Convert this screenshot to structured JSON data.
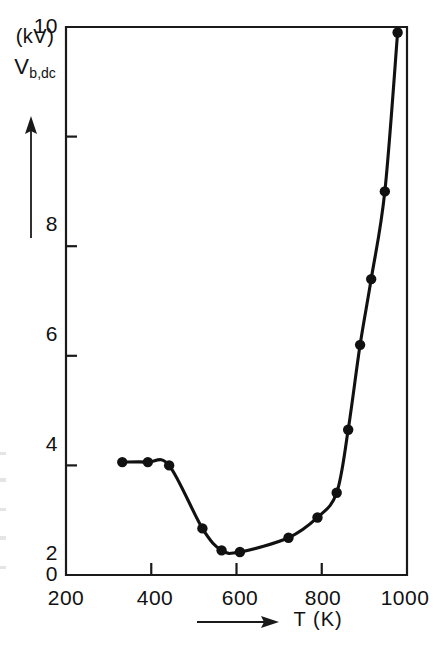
{
  "figure": {
    "title": "",
    "y_axis_caption_unit": "(kV)",
    "y_axis_caption_symbol": "V",
    "y_axis_caption_subscript": "b,dc",
    "x_axis_caption": "T  (K)",
    "arrow_up_icon": "up-arrow-icon",
    "arrow_right_icon": "right-arrow-icon"
  },
  "axes": {
    "x_ticks": [
      "200",
      "400",
      "600",
      "800",
      "1000"
    ],
    "y_ticks": [
      "0",
      "2",
      "4",
      "6",
      "8",
      "10"
    ]
  },
  "chart_data": {
    "type": "line",
    "title": "",
    "xlabel": "T (K)",
    "ylabel": "V_b,dc (kV)",
    "xlim": [
      200,
      1000
    ],
    "ylim": [
      0,
      10
    ],
    "xticks": [
      200,
      400,
      600,
      800,
      1000
    ],
    "yticks": [
      0,
      2,
      4,
      6,
      8,
      10
    ],
    "grid": false,
    "legend": null,
    "markers": "filled-circle",
    "series": [
      {
        "name": "V_b,dc",
        "x": [
          332,
          392,
          442,
          520,
          565,
          608,
          722,
          790,
          835,
          862,
          890,
          916,
          948,
          978
        ],
        "y": [
          2.06,
          2.06,
          2.0,
          0.85,
          0.45,
          0.42,
          0.68,
          1.05,
          1.5,
          2.65,
          4.2,
          5.4,
          7.0,
          9.9
        ]
      }
    ]
  }
}
